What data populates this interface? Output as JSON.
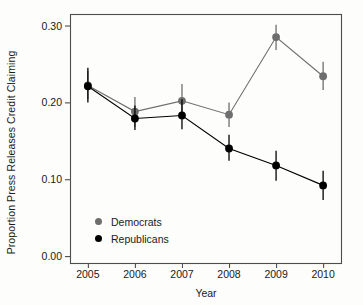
{
  "chart_data": {
    "type": "line",
    "title": "",
    "xlabel": "Year",
    "ylabel": "Proportion Press Releases Credit Claiming",
    "categories": [
      2005,
      2006,
      2007,
      2008,
      2009,
      2010
    ],
    "x": [
      2005,
      2006,
      2007,
      2008,
      2009,
      2010
    ],
    "xtick_labels": [
      "2005",
      "2006",
      "2007",
      "2008",
      "2009",
      "2010"
    ],
    "ytick_labels": [
      "0.00",
      "0.10",
      "0.20",
      "0.30"
    ],
    "ytick_values": [
      0.0,
      0.1,
      0.2,
      0.3
    ],
    "xlim": [
      2004.62,
      2010.38
    ],
    "ylim": [
      -0.009,
      0.315
    ],
    "grid": false,
    "legend_position": "bottom-left",
    "error_bars": "vertical 95% confidence intervals",
    "series": [
      {
        "name": "Democrats",
        "color": "#6e6e6e",
        "values": [
          0.222,
          0.188,
          0.202,
          0.184,
          0.285,
          0.234
        ],
        "err_low": [
          0.204,
          0.168,
          0.178,
          0.168,
          0.268,
          0.216
        ],
        "err_high": [
          0.241,
          0.207,
          0.224,
          0.2,
          0.301,
          0.253
        ]
      },
      {
        "name": "Republicans",
        "color": "#000000",
        "values": [
          0.221,
          0.179,
          0.183,
          0.14,
          0.118,
          0.092
        ],
        "err_low": [
          0.2,
          0.164,
          0.165,
          0.124,
          0.098,
          0.073
        ],
        "err_high": [
          0.245,
          0.196,
          0.204,
          0.158,
          0.137,
          0.111
        ]
      }
    ]
  },
  "legend": {
    "items": [
      {
        "label": "Democrats",
        "color": "#6e6e6e"
      },
      {
        "label": "Republicans",
        "color": "#000000"
      }
    ]
  },
  "axes": {
    "x_title": "Year",
    "y_title": "Proportion Press Releases Credit Claiming"
  },
  "colors": {
    "democrat": "#6e6e6e",
    "republican": "#000000",
    "frame": "#4d4d4d",
    "background": "#fdfdfb"
  }
}
